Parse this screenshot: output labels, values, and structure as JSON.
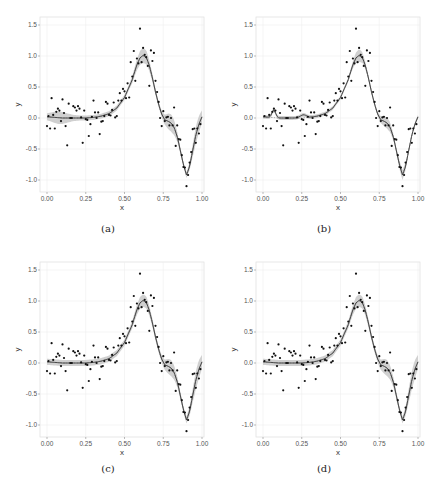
{
  "chart_data": [
    {
      "panel": "(a)",
      "type": "scatter",
      "title": "",
      "xlabel": "x",
      "ylabel": "y",
      "xlim": [
        -0.02,
        1.02
      ],
      "ylim": [
        -1.2,
        1.55
      ],
      "xticks": [
        "0.00",
        "0.25",
        "0.50",
        "0.75",
        "1.00"
      ],
      "yticks": [
        "-1.0",
        "-0.5",
        "0.0",
        "0.5",
        "1.0",
        "1.5"
      ],
      "grid": true,
      "caption": "(a)",
      "fit_band": "wide-at-bumps"
    },
    {
      "panel": "(b)",
      "type": "scatter",
      "xlabel": "x",
      "ylabel": "y",
      "xticks": [
        "0.00",
        "0.25",
        "0.50",
        "0.75",
        "1.00"
      ],
      "yticks": [
        "-1.0",
        "-0.5",
        "0.0",
        "0.5",
        "1.0",
        "1.5"
      ],
      "grid": true,
      "caption": "(b)",
      "fit_band": "narrow-with-bump-near-0.07"
    },
    {
      "panel": "(c)",
      "type": "scatter",
      "xlabel": "x",
      "ylabel": "y",
      "xticks": [
        "0.00",
        "0.25",
        "0.50",
        "0.75",
        "1.00"
      ],
      "yticks": [
        "-1.0",
        "-0.5",
        "0.0",
        "0.5",
        "1.0",
        "1.5"
      ],
      "grid": true,
      "caption": "(c)",
      "fit_band": "moderate"
    },
    {
      "panel": "(d)",
      "type": "scatter",
      "xlabel": "x",
      "ylabel": "y",
      "xticks": [
        "0.00",
        "0.25",
        "0.50",
        "0.75",
        "1.00"
      ],
      "yticks": [
        "-1.0",
        "-0.5",
        "0.0",
        "0.5",
        "1.0",
        "1.5"
      ],
      "grid": true,
      "caption": "(d)",
      "fit_band": "moderate"
    }
  ],
  "shared": {
    "points": [
      [
        0.0,
        -0.13
      ],
      [
        0.01,
        0.03
      ],
      [
        0.02,
        -0.17
      ],
      [
        0.03,
        0.32
      ],
      [
        0.04,
        0.05
      ],
      [
        0.05,
        -0.17
      ],
      [
        0.06,
        0.1
      ],
      [
        0.07,
        0.15
      ],
      [
        0.08,
        0.12
      ],
      [
        0.09,
        -0.05
      ],
      [
        0.1,
        0.3
      ],
      [
        0.11,
        0.08
      ],
      [
        0.12,
        -0.13
      ],
      [
        0.13,
        -0.44
      ],
      [
        0.14,
        0.23
      ],
      [
        0.15,
        0.0
      ],
      [
        0.16,
        0.0
      ],
      [
        0.17,
        0.19
      ],
      [
        0.18,
        0.17
      ],
      [
        0.19,
        0.12
      ],
      [
        0.2,
        0.19
      ],
      [
        0.21,
        0.15
      ],
      [
        0.22,
        0.01
      ],
      [
        0.23,
        -0.4
      ],
      [
        0.24,
        0.12
      ],
      [
        0.25,
        -0.02
      ],
      [
        0.26,
        -0.03
      ],
      [
        0.27,
        -0.29
      ],
      [
        0.28,
        -0.1
      ],
      [
        0.29,
        0.02
      ],
      [
        0.3,
        0.28
      ],
      [
        0.31,
        0.09
      ],
      [
        0.32,
        0.0
      ],
      [
        0.33,
        0.09
      ],
      [
        0.34,
        -0.26
      ],
      [
        0.35,
        -0.06
      ],
      [
        0.36,
        -0.05
      ],
      [
        0.37,
        0.03
      ],
      [
        0.38,
        0.26
      ],
      [
        0.39,
        0.23
      ],
      [
        0.4,
        0.05
      ],
      [
        0.41,
        0.04
      ],
      [
        0.42,
        0.13
      ],
      [
        0.43,
        0.25
      ],
      [
        0.44,
        0.01
      ],
      [
        0.45,
        0.03
      ],
      [
        0.46,
        0.28
      ],
      [
        0.47,
        0.4
      ],
      [
        0.48,
        0.28
      ],
      [
        0.49,
        0.47
      ],
      [
        0.5,
        0.43
      ],
      [
        0.51,
        0.32
      ],
      [
        0.52,
        0.56
      ],
      [
        0.53,
        0.33
      ],
      [
        0.54,
        0.9
      ],
      [
        0.55,
        0.67
      ],
      [
        0.56,
        1.08
      ],
      [
        0.57,
        0.6
      ],
      [
        0.58,
        0.96
      ],
      [
        0.59,
        0.88
      ],
      [
        0.6,
        1.44
      ],
      [
        0.61,
        0.9
      ],
      [
        0.62,
        1.13
      ],
      [
        0.63,
        1.02
      ],
      [
        0.64,
        0.98
      ],
      [
        0.65,
        0.84
      ],
      [
        0.66,
        0.52
      ],
      [
        0.67,
        1.09
      ],
      [
        0.68,
        0.92
      ],
      [
        0.69,
        1.05
      ],
      [
        0.7,
        0.6
      ],
      [
        0.71,
        0.42
      ],
      [
        0.72,
        0.26
      ],
      [
        0.73,
        0.0
      ],
      [
        0.74,
        -0.13
      ],
      [
        0.75,
        0.11
      ],
      [
        0.76,
        -0.05
      ],
      [
        0.77,
        0.01
      ],
      [
        0.78,
        0.02
      ],
      [
        0.79,
        -0.12
      ],
      [
        0.8,
        0.0
      ],
      [
        0.81,
        -0.12
      ],
      [
        0.82,
        0.17
      ],
      [
        0.83,
        -0.45
      ],
      [
        0.84,
        -0.12
      ],
      [
        0.85,
        -0.34
      ],
      [
        0.86,
        -0.35
      ],
      [
        0.87,
        -0.6
      ],
      [
        0.88,
        -0.79
      ],
      [
        0.89,
        -0.8
      ],
      [
        0.9,
        -1.1
      ],
      [
        0.91,
        -0.92
      ],
      [
        0.92,
        -0.72
      ],
      [
        0.93,
        -0.55
      ],
      [
        0.94,
        -0.18
      ],
      [
        0.95,
        -0.17
      ],
      [
        0.96,
        -0.4
      ],
      [
        0.97,
        -0.17
      ],
      [
        0.98,
        -0.25
      ],
      [
        0.99,
        -0.1
      ]
    ],
    "fit_curve": [
      [
        0.0,
        0.02
      ],
      [
        0.05,
        0.01
      ],
      [
        0.1,
        0.0
      ],
      [
        0.15,
        0.0
      ],
      [
        0.2,
        0.0
      ],
      [
        0.25,
        0.0
      ],
      [
        0.3,
        0.01
      ],
      [
        0.35,
        0.03
      ],
      [
        0.4,
        0.07
      ],
      [
        0.45,
        0.16
      ],
      [
        0.5,
        0.33
      ],
      [
        0.55,
        0.62
      ],
      [
        0.58,
        0.86
      ],
      [
        0.6,
        0.97
      ],
      [
        0.62,
        1.01
      ],
      [
        0.64,
        0.98
      ],
      [
        0.66,
        0.85
      ],
      [
        0.68,
        0.65
      ],
      [
        0.7,
        0.42
      ],
      [
        0.72,
        0.22
      ],
      [
        0.74,
        0.06
      ],
      [
        0.76,
        -0.03
      ],
      [
        0.78,
        -0.05
      ],
      [
        0.8,
        -0.08
      ],
      [
        0.82,
        -0.15
      ],
      [
        0.84,
        -0.3
      ],
      [
        0.86,
        -0.52
      ],
      [
        0.88,
        -0.75
      ],
      [
        0.9,
        -0.92
      ],
      [
        0.92,
        -0.78
      ],
      [
        0.94,
        -0.52
      ],
      [
        0.96,
        -0.28
      ],
      [
        0.98,
        -0.1
      ],
      [
        1.0,
        0.02
      ]
    ]
  },
  "captions": [
    "(a)",
    "(b)",
    "(c)",
    "(d)"
  ],
  "axis": {
    "xlabel": "x",
    "ylabel": "y",
    "xticks": [
      "0.00",
      "0.25",
      "0.50",
      "0.75",
      "1.00"
    ],
    "yticks": [
      "1.5",
      "1.0",
      "0.5",
      "0.0",
      "-0.5",
      "-1.0"
    ]
  },
  "colors": {
    "point": "#111111",
    "line": "#333333",
    "band": "#c8c8c8",
    "grid": "#eeeeee",
    "frame": "#e2e2e2"
  }
}
